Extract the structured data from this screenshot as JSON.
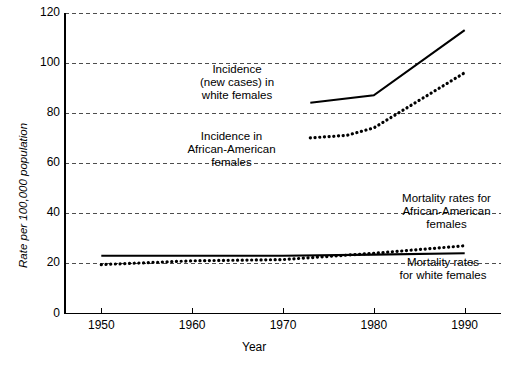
{
  "chart_data": {
    "type": "line",
    "title": "",
    "xlabel": "Year",
    "ylabel": "Rate per 100,000 population",
    "xlim": [
      1946,
      1994
    ],
    "ylim": [
      0,
      120
    ],
    "xticks": [
      1950,
      1960,
      1970,
      1980,
      1990
    ],
    "xtick_labels": [
      "1950",
      "1960",
      "1970",
      "1980",
      "1990"
    ],
    "yticks": [
      0,
      20,
      40,
      60,
      80,
      100,
      120
    ],
    "ytick_labels": [
      "0",
      "20",
      "40",
      "60",
      "80",
      "100",
      "120"
    ],
    "grid": "horizontal-dashed",
    "legend": "inline-annotations",
    "series": [
      {
        "name": "Incidence (new cases) in white females",
        "style": "solid",
        "x": [
          1973,
          1980,
          1990
        ],
        "values": [
          84,
          87,
          113
        ]
      },
      {
        "name": "Incidence in African-American females",
        "style": "dotted",
        "x": [
          1973,
          1977,
          1980,
          1990
        ],
        "values": [
          70,
          71,
          74,
          96
        ]
      },
      {
        "name": "Mortality rates for white females",
        "style": "solid",
        "x": [
          1950,
          1960,
          1970,
          1980,
          1990
        ],
        "values": [
          23,
          23,
          23,
          23.5,
          24
        ]
      },
      {
        "name": "Mortality rates for African-American females",
        "style": "dotted",
        "x": [
          1950,
          1960,
          1970,
          1980,
          1990
        ],
        "values": [
          19.5,
          21,
          21.5,
          24,
          27
        ]
      }
    ],
    "annotations": [
      {
        "id": "incidence-white",
        "lines": [
          "Incidence",
          "(new cases) in",
          "white females"
        ]
      },
      {
        "id": "incidence-aa",
        "lines": [
          "Incidence in",
          "African-American",
          "females"
        ]
      },
      {
        "id": "mortality-aa",
        "lines": [
          "Mortality rates for",
          "African-American",
          "females"
        ]
      },
      {
        "id": "mortality-white",
        "lines": [
          "Mortality rates",
          "for white females"
        ]
      }
    ],
    "colors": {
      "line": "#000000",
      "grid": "#555555",
      "axis": "#000000",
      "background": "#ffffff"
    }
  }
}
